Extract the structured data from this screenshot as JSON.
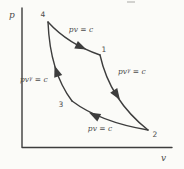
{
  "colors": {
    "background": "#fbfbf8",
    "line": "#3d3d3d",
    "text": "#4b4b4b"
  },
  "axes": {
    "y_label": "p",
    "x_label": "v"
  },
  "points": {
    "p1": "1",
    "p2": "2",
    "p3": "3",
    "p4": "4"
  },
  "process_labels": {
    "top_isotherm": "pv = c",
    "bottom_isotherm": "pv = c",
    "adiabat_base": "pv",
    "adiabat_sup": "γ",
    "adiabat_rest": " = c"
  },
  "cycle": {
    "processes": [
      {
        "from": "4",
        "to": "1",
        "equation": "pv = c"
      },
      {
        "from": "1",
        "to": "2",
        "equation": "pvγ = c"
      },
      {
        "from": "2",
        "to": "3",
        "equation": "pv = c"
      },
      {
        "from": "3",
        "to": "4",
        "equation": "pvγ = c"
      }
    ]
  }
}
